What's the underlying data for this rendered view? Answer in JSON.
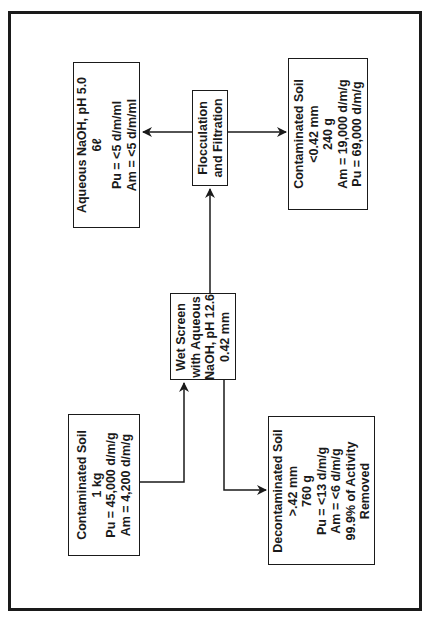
{
  "diagram": {
    "orientation": "rotated-90-ccw",
    "nodes": {
      "feed": {
        "lines": [
          "Contaminated Soil",
          "1 kg",
          "Pu = 45,000 d/m/g",
          "Am = 4,200 d/m/g"
        ]
      },
      "wet_screen": {
        "lines": [
          "Wet Screen",
          "with Aqueous",
          "NaOH, pH 12.6",
          "0.42 mm"
        ]
      },
      "decontaminated": {
        "lines": [
          "Decontaminated Soil",
          ">.42 mm",
          "760 g",
          "Pu = <13 d/m/g",
          "Am = <6 d/m/g",
          "99.9% of Activity",
          "Removed"
        ]
      },
      "flocculation": {
        "lines": [
          "Flocculation",
          "and Filtration"
        ]
      },
      "aqueous": {
        "lines": [
          "Aqueous NaOH, pH 5.0",
          "6ℓ",
          "",
          "Pu = <5 d/m/ml",
          "Am = <5 d/m/ml"
        ]
      },
      "fines": {
        "lines": [
          "Contaminated Soil",
          "<0.42 mm",
          "240 g",
          "Am = 19,000 d/m/g",
          "Pu = 69,000 d/m/g"
        ]
      }
    },
    "edges": [
      {
        "from": "feed",
        "to": "wet_screen"
      },
      {
        "from": "wet_screen",
        "to": "decontaminated"
      },
      {
        "from": "wet_screen",
        "to": "flocculation"
      },
      {
        "from": "flocculation",
        "to": "aqueous"
      },
      {
        "from": "flocculation",
        "to": "fines"
      }
    ],
    "colors": {
      "line": "#1a1a1a",
      "background": "#ffffff"
    }
  }
}
